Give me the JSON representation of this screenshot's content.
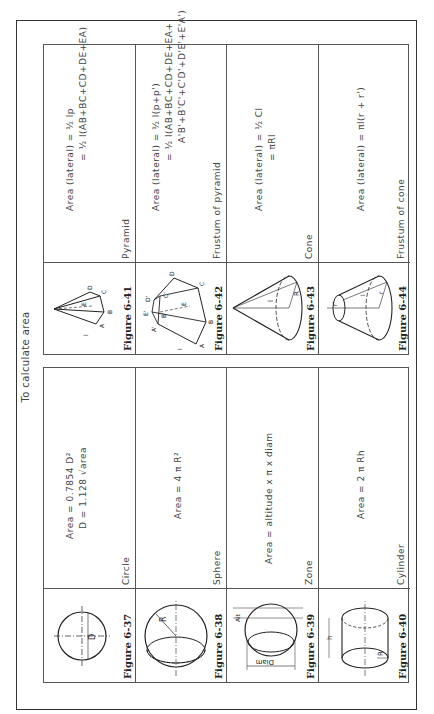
{
  "title": "To calculate area",
  "left_table": [
    {
      "figure": "Figure 6-37",
      "shape": "Circle",
      "formula_lines": [
        "Area = 0.7854 D²",
        "D = 1.128 √area"
      ],
      "icon": "circle-diagram-icon"
    },
    {
      "figure": "Figure 6-38",
      "shape": "Sphere",
      "formula_lines": [
        "Area = 4 π R²"
      ],
      "icon": "sphere-diagram-icon"
    },
    {
      "figure": "Figure 6-39",
      "shape": "Zone",
      "formula_lines": [
        "Area = altitude x π x diam"
      ],
      "icon": "zone-diagram-icon"
    },
    {
      "figure": "Figure 6-40",
      "shape": "Cylinder",
      "formula_lines": [
        "Area = 2 π Rh"
      ],
      "icon": "cylinder-diagram-icon"
    }
  ],
  "right_table": [
    {
      "figure": "Figure 6-41",
      "shape": "Pyramid",
      "formula_lines": [
        "Area (lateral) = ½ lp",
        "= ½ l(AB+BC+CD+DE+EA)"
      ],
      "icon": "pyramid-diagram-icon"
    },
    {
      "figure": "Figure 6-42",
      "shape": "Frustum of pyramid",
      "formula_lines": [
        "Area (lateral) = ½ l(p+p')",
        "= ½ l(AB+BC+CD+DE+EA+",
        "A'B'+B'C'+C'D'+D'E'+E'A')"
      ],
      "icon": "pyramid-frustum-diagram-icon"
    },
    {
      "figure": "Figure 6-43",
      "shape": "Cone",
      "formula_lines": [
        "Area (lateral) = ½ Cl",
        "= πRl"
      ],
      "icon": "cone-diagram-icon"
    },
    {
      "figure": "Figure 6-44",
      "shape": "Frustum of cone",
      "formula_lines": [
        "Area (lateral) = πl(r + r')"
      ],
      "icon": "cone-frustum-diagram-icon"
    }
  ],
  "diagram_labels": {
    "circle_d": "D",
    "sphere_r": "R",
    "zone_diam": "Diam",
    "zone_alt": "Alt",
    "cyl_h": "h",
    "cyl_r": "R",
    "pyr_pts": [
      "A",
      "B",
      "C",
      "D",
      "E",
      "l"
    ],
    "frus_pts": [
      "A",
      "B",
      "C",
      "D",
      "E",
      "A'",
      "B'",
      "C'",
      "D'",
      "E'",
      "l"
    ],
    "cone_l": "l",
    "cone_r": "R",
    "fcone_r1": "r'",
    "fcone_r": "r",
    "fcone_l": "l"
  }
}
